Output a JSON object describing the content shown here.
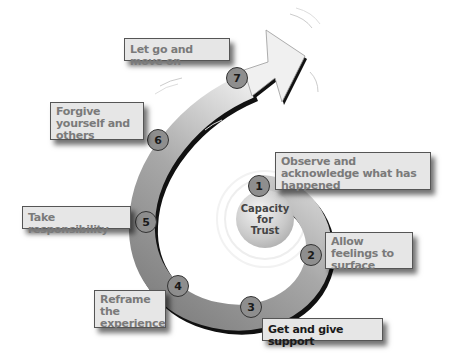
{
  "diagram": {
    "center": {
      "line1": "Capacity",
      "line2": "for",
      "line3": "Trust"
    },
    "steps": [
      {
        "number": "1",
        "label": "Observe and acknowledge what has happened"
      },
      {
        "number": "2",
        "label": "Allow feelings to surface"
      },
      {
        "number": "3",
        "label": "Get and give support"
      },
      {
        "number": "4",
        "label": "Reframe the experience"
      },
      {
        "number": "5",
        "label": "Take responsibility"
      },
      {
        "number": "6",
        "label": "Forgive yourself and others"
      },
      {
        "number": "7",
        "label": "Let go and move on"
      }
    ],
    "colors": {
      "band_dark": "#7d7d7d",
      "band_light": "#dcdcdc",
      "box_bg": "#e6e6e6",
      "text_gray": "#7a7a7a"
    }
  }
}
